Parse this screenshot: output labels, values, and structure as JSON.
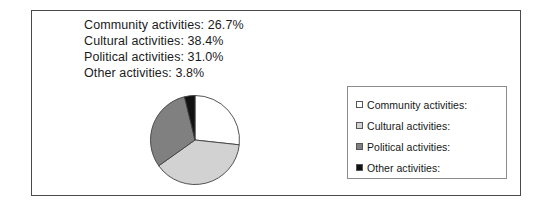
{
  "figure": {
    "border_color": "#4a4a4a",
    "background": "#ffffff"
  },
  "caption": {
    "lines": [
      "Community activities: 26.7%",
      "Cultural activities: 38.4%",
      "Political activities: 31.0%",
      "Other activities: 3.8%"
    ]
  },
  "legend": {
    "border_color": "#8c8c8c",
    "items": [
      {
        "label": "Community activities:",
        "color": "#ffffff",
        "swatch_name": "legend-swatch-community"
      },
      {
        "label": "Cultural activities:",
        "color": "#d2d2d2",
        "swatch_name": "legend-swatch-cultural"
      },
      {
        "label": "Political activities:",
        "color": "#808080",
        "swatch_name": "legend-swatch-political"
      },
      {
        "label": "Other activities:",
        "color": "#111111",
        "swatch_name": "legend-swatch-other"
      }
    ]
  },
  "chart_data": {
    "type": "pie",
    "title": "",
    "xlabel": "",
    "ylabel": "",
    "categories": [
      "Community activities",
      "Cultural activities",
      "Political activities",
      "Other activities"
    ],
    "values": [
      26.7,
      38.4,
      31.0,
      3.8
    ],
    "value_unit": "%",
    "colors": [
      "#ffffff",
      "#d2d2d2",
      "#808080",
      "#111111"
    ],
    "slice_border_color": "#3f3f3f",
    "start_angle_deg": 0,
    "direction": "clockwise",
    "legend_position": "right",
    "grid": false,
    "annotations": [
      "Community activities: 26.7%",
      "Cultural activities: 38.4%",
      "Political activities: 31.0%",
      "Other activities: 3.8%"
    ]
  }
}
